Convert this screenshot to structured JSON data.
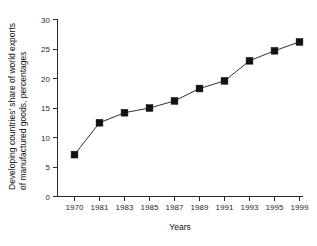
{
  "chart_data": {
    "type": "line",
    "title": "",
    "xlabel": "Years",
    "ylabel": "Developing countries' share of world exports of manufactured goods, percentages",
    "ylabel_lines": [
      "Developing countries' share of world exports",
      "of manufactured goods, percentages"
    ],
    "categories": [
      "1970",
      "1981",
      "1983",
      "1985",
      "1987",
      "1989",
      "1991",
      "1993",
      "1995",
      "1999"
    ],
    "values": [
      7.1,
      12.5,
      14.2,
      15.0,
      16.2,
      18.3,
      19.6,
      23.0,
      24.7,
      26.2
    ],
    "x_tick_labels": [
      "1970",
      "1981",
      "1983",
      "1985",
      "1987",
      "1989",
      "1991",
      "1993",
      "1995",
      "1999"
    ],
    "y_tick_labels": [
      "0",
      "5",
      "10",
      "15",
      "20",
      "25",
      "30"
    ],
    "y_ticks": [
      0,
      5,
      10,
      15,
      20,
      25,
      30
    ],
    "ylim": [
      0,
      30
    ],
    "grid": false,
    "legend": null,
    "legend_position": "none",
    "marker": "square",
    "series_color": "#111111",
    "background_color": "#ffffff",
    "axis_color": "#2b2b2b"
  }
}
